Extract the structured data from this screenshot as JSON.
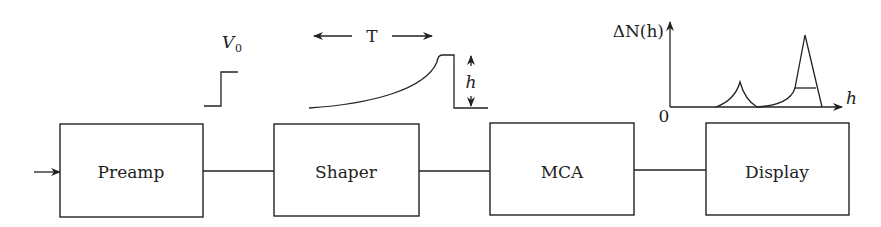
{
  "blocks": [
    {
      "id": "preamp",
      "label": "Preamp"
    },
    {
      "id": "shaper",
      "label": "Shaper"
    },
    {
      "id": "mca",
      "label": "MCA"
    },
    {
      "id": "display",
      "label": "Display"
    }
  ],
  "signals": {
    "preamp_output": {
      "label_main": "V",
      "label_sub": "0"
    },
    "shaper_output": {
      "period_label": "T",
      "height_label": "h"
    }
  },
  "spectrum": {
    "y_axis_label": "ΔN(h)",
    "x_axis_label": "h",
    "origin_label": "0"
  },
  "colors": {
    "stroke": "#222222",
    "background": "#ffffff"
  }
}
